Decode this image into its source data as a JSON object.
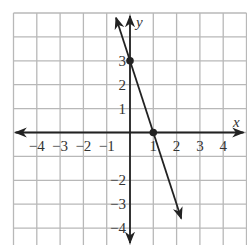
{
  "chart_data": {
    "type": "line",
    "title": "",
    "xlabel": "x",
    "ylabel": "y",
    "xlim": [
      -5,
      5
    ],
    "ylim": [
      -4.5,
      5
    ],
    "grid": true,
    "x_ticks": [
      -4,
      -3,
      -2,
      -1,
      1,
      2,
      3,
      4
    ],
    "x_tick_labels": [
      "−4",
      "−3",
      "−2",
      "−1",
      "1",
      "2",
      "3",
      "4"
    ],
    "y_ticks": [
      3,
      2,
      1,
      -2,
      -3,
      -4
    ],
    "y_tick_labels": [
      "3",
      "2",
      "1",
      "−2",
      "−3",
      "−4"
    ],
    "series": [
      {
        "name": "y = -3x + 3",
        "equation": "y = -3x + 3",
        "line_start": [
          -0.6,
          4.8
        ],
        "line_end": [
          2.2,
          -3.6
        ],
        "arrows": "both",
        "points": [
          {
            "x": 0,
            "y": 3,
            "label": "y-intercept"
          },
          {
            "x": 1,
            "y": 0,
            "label": "x-intercept"
          }
        ]
      }
    ],
    "colors": {
      "grid": "#b8b8b8",
      "axes": "#222222",
      "line": "#222222"
    }
  }
}
